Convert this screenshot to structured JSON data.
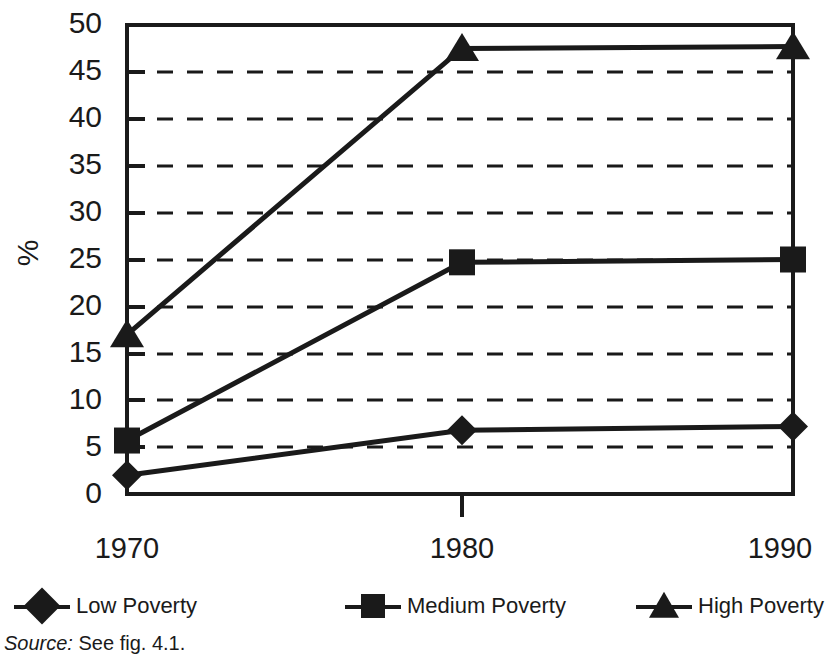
{
  "chart_data": {
    "type": "line",
    "title": "",
    "xlabel": "",
    "ylabel": "%",
    "categories": [
      "1970",
      "1980",
      "1990"
    ],
    "x": [
      1970,
      1980,
      1990
    ],
    "series": [
      {
        "name": "Low Poverty",
        "marker": "diamond",
        "values": [
          2.0,
          6.8,
          7.2
        ]
      },
      {
        "name": "Medium Poverty",
        "marker": "square",
        "values": [
          5.7,
          24.7,
          25.0
        ]
      },
      {
        "name": "High Poverty",
        "marker": "triangle",
        "values": [
          17.0,
          47.5,
          47.7
        ]
      }
    ],
    "ylim": [
      0,
      50
    ],
    "ytick_labels": [
      "50",
      "45",
      "40",
      "35",
      "30",
      "25",
      "20",
      "15",
      "10",
      "5",
      "0"
    ],
    "ytick_values": [
      50,
      45,
      40,
      35,
      30,
      25,
      20,
      15,
      10,
      5,
      0
    ],
    "grid": true,
    "grid_style": "dashed-horizontal",
    "legend_position": "bottom",
    "line_color": "#1a1a1a",
    "marker_color": "#1a1a1a",
    "grid_color": "#1a1a1a",
    "background": "#ffffff"
  },
  "axis": {
    "y_title": "%",
    "x_labels": [
      "1970",
      "1980",
      "1990"
    ]
  },
  "legend": {
    "items": [
      {
        "label": "Low Poverty",
        "marker": "diamond-marker"
      },
      {
        "label": "Medium Poverty",
        "marker": "square-marker"
      },
      {
        "label": "High Poverty",
        "marker": "triangle-marker"
      }
    ]
  },
  "source": {
    "prefix": "Source:",
    "text": "See fig. 4.1."
  }
}
